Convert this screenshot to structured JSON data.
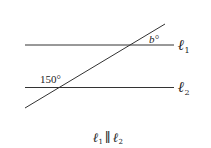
{
  "diagram": {
    "type": "parallel-lines-transversal",
    "lines": [
      {
        "id": "l1",
        "label": "ℓ",
        "subscript": "1"
      },
      {
        "id": "l2",
        "label": "ℓ",
        "subscript": "2"
      }
    ],
    "angles": {
      "top_angle": "b°",
      "bottom_angle": "150°"
    },
    "caption": {
      "left": "ℓ",
      "left_sub": "1",
      "relation": "∥",
      "right": "ℓ",
      "right_sub": "2"
    }
  },
  "colors": {
    "line": "#333333",
    "text": "#222222",
    "background": "#ffffff"
  }
}
